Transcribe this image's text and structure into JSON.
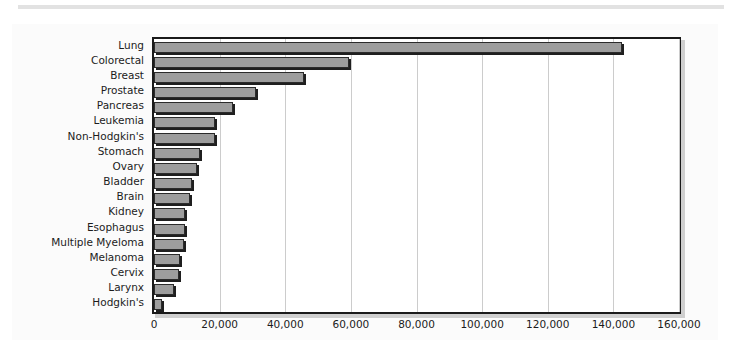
{
  "figure": {
    "caption": ""
  },
  "chart_data": {
    "type": "bar",
    "orientation": "horizontal",
    "title": "",
    "xlabel": "",
    "ylabel": "",
    "xlim": [
      0,
      160000
    ],
    "xticks": [
      0,
      20000,
      40000,
      60000,
      80000,
      100000,
      120000,
      140000,
      160000
    ],
    "xtick_labels": [
      "0",
      "20,000",
      "40,000",
      "60,000",
      "80,000",
      "100,000",
      "120,000",
      "140,000",
      "160,000"
    ],
    "grid": true,
    "grid_axis": "x",
    "legend": null,
    "bar_color": "#9d9d9d",
    "bar_edge_color": "#2b2b2b",
    "plot_background": "#ffffff",
    "figure_background": "#fbfbfb",
    "categories": [
      "Lung",
      "Colorectal",
      "Breast",
      "Prostate",
      "Pancreas",
      "Leukemia",
      "Non-Hodgkin's",
      "Stomach",
      "Ovary",
      "Bladder",
      "Brain",
      "Kidney",
      "Esophagus",
      "Multiple Myeloma",
      "Melanoma",
      "Cervix",
      "Larynx",
      "Hodgkin's"
    ],
    "values": [
      142700,
      59500,
      45800,
      31000,
      24000,
      18500,
      18500,
      14000,
      13000,
      11500,
      11000,
      9500,
      9500,
      9000,
      7800,
      7500,
      6000,
      2500
    ]
  }
}
